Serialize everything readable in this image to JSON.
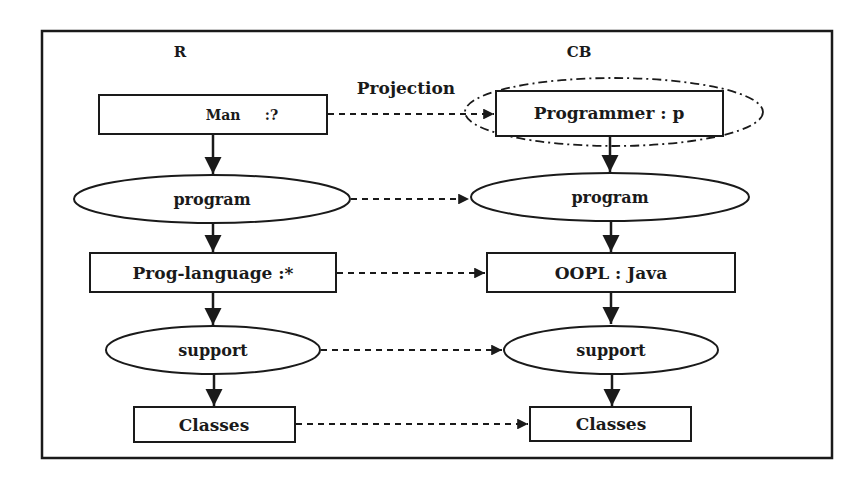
{
  "diagram": {
    "columns": {
      "left": {
        "label": "R"
      },
      "right": {
        "label": "CB"
      }
    },
    "projection_label": "Projection",
    "left_nodes": [
      {
        "shape": "rect",
        "label": "Man     :?"
      },
      {
        "shape": "ellipse",
        "label": "program"
      },
      {
        "shape": "rect",
        "label": "Prog-language :*"
      },
      {
        "shape": "ellipse",
        "label": "support"
      },
      {
        "shape": "rect",
        "label": "Classes"
      }
    ],
    "right_nodes": [
      {
        "shape": "rect",
        "label": "Programmer : p",
        "highlighted": true
      },
      {
        "shape": "ellipse",
        "label": "program"
      },
      {
        "shape": "rect",
        "label": "OOPL : Java"
      },
      {
        "shape": "ellipse",
        "label": "support"
      },
      {
        "shape": "rect",
        "label": "Classes"
      }
    ],
    "edges": {
      "vertical": "solid arrows down each column",
      "horizontal": "dashed arrows from R node to CB node"
    },
    "colors": {
      "stroke": "#1a1a1a",
      "background": "#ffffff"
    }
  }
}
